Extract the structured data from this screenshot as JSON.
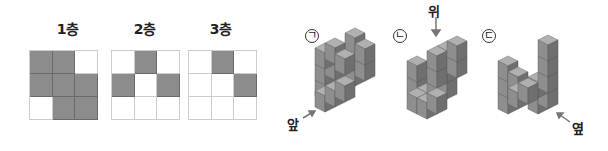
{
  "layers": [
    {
      "label": "1층",
      "grid": [
        [
          1,
          1,
          0
        ],
        [
          1,
          1,
          1
        ],
        [
          0,
          1,
          1
        ]
      ]
    },
    {
      "label": "2층",
      "grid": [
        [
          0,
          1,
          0
        ],
        [
          1,
          0,
          1
        ],
        [
          0,
          0,
          0
        ]
      ]
    },
    {
      "label": "3층",
      "grid": [
        [
          0,
          1,
          0
        ],
        [
          0,
          0,
          1
        ],
        [
          0,
          0,
          0
        ]
      ]
    }
  ],
  "figures": [
    {
      "marker": "ㄱ",
      "direction_label": "앞"
    },
    {
      "marker": "ㄴ",
      "direction_label": "위"
    },
    {
      "marker": "ㄷ",
      "direction_label": "옆"
    }
  ],
  "colors": {
    "filled": "#8c8c8c",
    "cube_top": "#b0b0b0",
    "cube_left": "#8e8e8e",
    "cube_right": "#6f6f6f",
    "grid_line": "#cccccc"
  }
}
